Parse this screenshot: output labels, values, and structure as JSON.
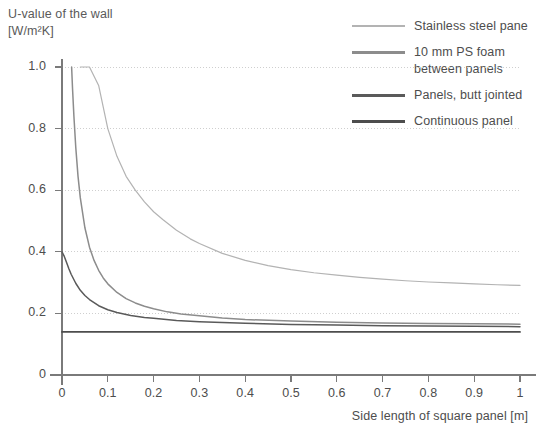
{
  "chart_data": {
    "type": "line",
    "title": "U-value of the wall\n[W/m²K]",
    "xlabel": "Side length of square panel [m]",
    "ylabel": "U-value of the wall [W/m²K]",
    "xlim": [
      0,
      1
    ],
    "ylim": [
      0,
      1.05
    ],
    "xticks": [
      "0",
      "0.1",
      "0.2",
      "0.3",
      "0.4",
      "0.5",
      "0.6",
      "0.7",
      "0.8",
      "0.9",
      "1"
    ],
    "xtick_values": [
      0,
      0.1,
      0.2,
      0.3,
      0.4,
      0.5,
      0.6,
      0.7,
      0.8,
      0.9,
      1
    ],
    "yticks": [
      "0",
      "0.2",
      "0.4",
      "0.6",
      "0.8",
      "1.0"
    ],
    "ytick_values": [
      0,
      0.2,
      0.4,
      0.6,
      0.8,
      1.0
    ],
    "grid": "horizontal-dotted",
    "grid_color": "#cfcfcf",
    "axis_color": "#7a7a7a",
    "legend_position": "top-right",
    "series": [
      {
        "name": "Stainless steel pane",
        "color": "#b3b3b3",
        "x": [
          0.04,
          0.06,
          0.08,
          0.1,
          0.12,
          0.14,
          0.16,
          0.18,
          0.2,
          0.22,
          0.25,
          0.28,
          0.3,
          0.35,
          0.4,
          0.45,
          0.5,
          0.55,
          0.6,
          0.65,
          0.7,
          0.75,
          0.8,
          0.85,
          0.9,
          0.95,
          1.0
        ],
        "y": [
          1.0,
          1.0,
          0.94,
          0.8,
          0.71,
          0.645,
          0.6,
          0.562,
          0.53,
          0.505,
          0.47,
          0.442,
          0.427,
          0.395,
          0.372,
          0.355,
          0.342,
          0.332,
          0.324,
          0.317,
          0.311,
          0.306,
          0.302,
          0.299,
          0.296,
          0.293,
          0.291
        ]
      },
      {
        "name": "10 mm PS foam\nbetween panels",
        "color": "#8c8c8c",
        "x": [
          0.021,
          0.023,
          0.026,
          0.03,
          0.035,
          0.04,
          0.05,
          0.06,
          0.07,
          0.08,
          0.09,
          0.1,
          0.12,
          0.14,
          0.16,
          0.18,
          0.2,
          0.23,
          0.26,
          0.3,
          0.35,
          0.4,
          0.5,
          0.6,
          0.7,
          0.8,
          0.9,
          1.0
        ],
        "y": [
          1.0,
          0.93,
          0.84,
          0.74,
          0.645,
          0.575,
          0.478,
          0.415,
          0.372,
          0.34,
          0.315,
          0.296,
          0.268,
          0.248,
          0.234,
          0.223,
          0.215,
          0.205,
          0.198,
          0.192,
          0.185,
          0.18,
          0.175,
          0.171,
          0.169,
          0.167,
          0.166,
          0.165
        ]
      },
      {
        "name": "Panels, butt jointed",
        "color": "#5a5a5a",
        "x": [
          0.0,
          0.005,
          0.01,
          0.015,
          0.02,
          0.03,
          0.04,
          0.05,
          0.06,
          0.08,
          0.1,
          0.12,
          0.15,
          0.18,
          0.2,
          0.25,
          0.3,
          0.4,
          0.5,
          0.6,
          0.7,
          0.8,
          0.9,
          1.0
        ],
        "y": [
          0.4,
          0.385,
          0.365,
          0.345,
          0.327,
          0.298,
          0.275,
          0.258,
          0.245,
          0.225,
          0.212,
          0.203,
          0.193,
          0.187,
          0.184,
          0.177,
          0.173,
          0.168,
          0.164,
          0.162,
          0.16,
          0.159,
          0.158,
          0.157
        ]
      },
      {
        "name": "Continuous panel",
        "color": "#4d4d4d",
        "x": [
          0.0,
          1.0
        ],
        "y": [
          0.14,
          0.14
        ]
      }
    ]
  },
  "legend": {
    "items": [
      {
        "label": "Stainless steel pane",
        "color": "#b3b3b3"
      },
      {
        "label": "10 mm PS foam\nbetween panels",
        "color": "#8c8c8c"
      },
      {
        "label": "Panels, butt jointed",
        "color": "#5a5a5a"
      },
      {
        "label": "Continuous panel",
        "color": "#4d4d4d"
      }
    ]
  },
  "axes": {
    "y_title": "U-value of the wall\n[W/m²K]",
    "x_title": "Side length of square panel [m]"
  }
}
